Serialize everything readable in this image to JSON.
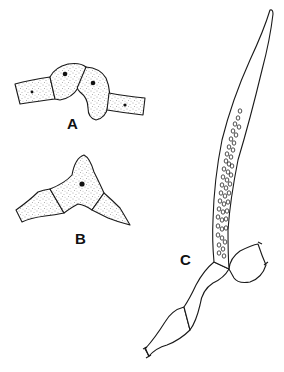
{
  "figure": {
    "type": "biological line illustration",
    "panels": [
      {
        "id": "A",
        "label": "A",
        "description": "filament of stippled cells with two swollen central cells, each with a nucleus"
      },
      {
        "id": "B",
        "label": "B",
        "description": "filament with a swollen pointed cell containing a nucleus"
      },
      {
        "id": "C",
        "label": "C",
        "description": "long tapering tube with many small round spores arising from a branched filament"
      }
    ],
    "colors": {
      "ink": "#1a1a1a",
      "background": "#ffffff"
    }
  }
}
